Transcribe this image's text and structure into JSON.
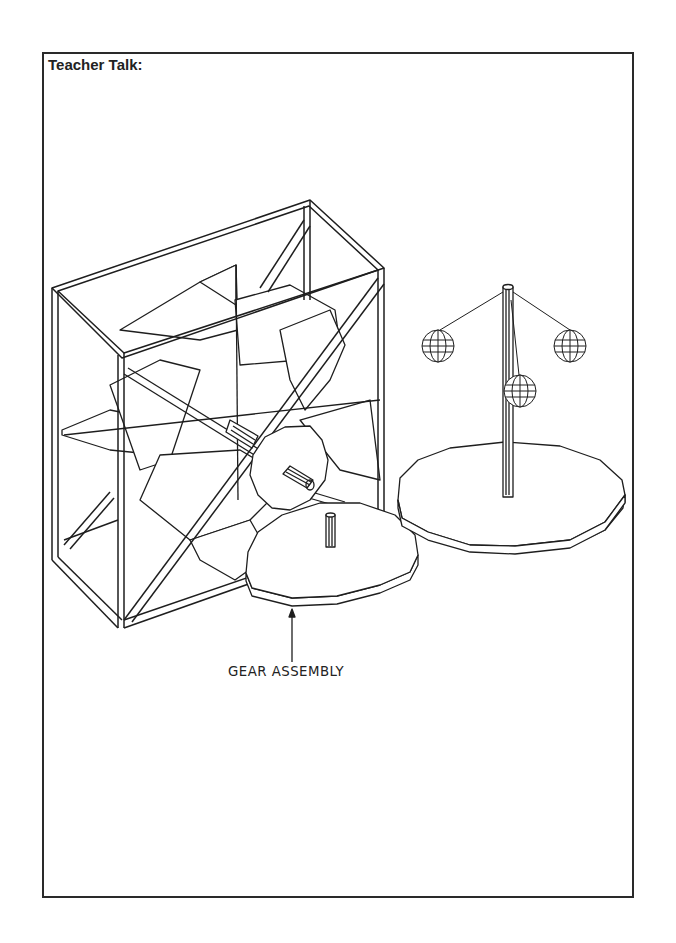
{
  "page": {
    "heading": "Teacher Talk:",
    "figure": {
      "caption": "GEAR ASSEMBLY",
      "components": [
        "windmill-frame",
        "rotor-blades",
        "drive-shaft",
        "small-gear",
        "large-gear",
        "carousel-turntable",
        "center-pole",
        "hanging-spheres"
      ]
    }
  }
}
